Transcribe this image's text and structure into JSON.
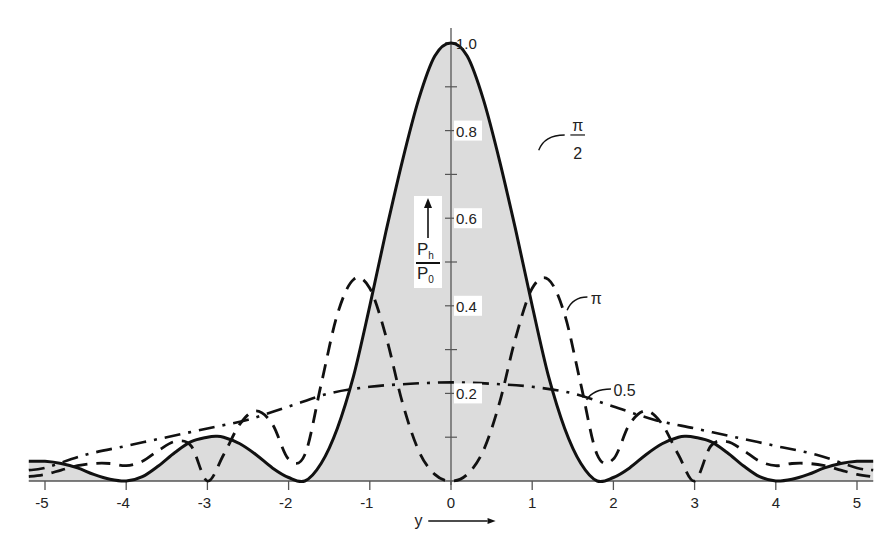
{
  "chart_data": {
    "type": "line",
    "title": "",
    "xlabel": "y",
    "ylabel": "Ph/P0",
    "ylabel_numerator": "P",
    "ylabel_numerator_sub": "h",
    "ylabel_denominator": "P",
    "ylabel_denominator_sub": "0",
    "xlim": [
      -5.2,
      5.2
    ],
    "ylim": [
      0,
      1.0
    ],
    "x_ticks": [
      -5,
      -4,
      -3,
      -2,
      -1,
      0,
      1,
      2,
      3,
      4,
      5
    ],
    "x_tick_labels": [
      "-5",
      "-4",
      "-3",
      "-2",
      "-1",
      "0",
      "1",
      "2",
      "3",
      "4",
      "5"
    ],
    "y_ticks": [
      0.2,
      0.4,
      0.6,
      0.8,
      1.0
    ],
    "y_tick_labels": [
      "0.2",
      "0.4",
      "0.6",
      "0.8",
      "1.0"
    ],
    "grid": false,
    "legend": "inline annotations",
    "series": [
      {
        "name": "π/2",
        "label_num": "π",
        "label_den": "2",
        "style": "solid",
        "filled": true,
        "x": [
          -5.2,
          -5.0,
          -4.8,
          -4.6,
          -4.4,
          -4.2,
          -4.0,
          -3.8,
          -3.6,
          -3.4,
          -3.2,
          -3.0,
          -2.9,
          -2.8,
          -2.6,
          -2.4,
          -2.2,
          -2.0,
          -1.8,
          -1.6,
          -1.4,
          -1.2,
          -1.0,
          -0.8,
          -0.6,
          -0.4,
          -0.2,
          0,
          0.2,
          0.4,
          0.6,
          0.8,
          1.0,
          1.2,
          1.4,
          1.6,
          1.8,
          2.0,
          2.2,
          2.4,
          2.6,
          2.8,
          2.9,
          3.0,
          3.2,
          3.4,
          3.6,
          3.8,
          4.0,
          4.2,
          4.4,
          4.6,
          4.8,
          5.0,
          5.2
        ],
        "values": [
          0.045,
          0.045,
          0.04,
          0.03,
          0.015,
          0.004,
          0.0,
          0.01,
          0.035,
          0.065,
          0.09,
          0.1,
          0.102,
          0.1,
          0.085,
          0.06,
          0.03,
          0.008,
          0.0,
          0.04,
          0.12,
          0.24,
          0.4,
          0.57,
          0.73,
          0.87,
          0.97,
          1.0,
          0.97,
          0.87,
          0.73,
          0.57,
          0.4,
          0.24,
          0.12,
          0.04,
          0.0,
          0.008,
          0.03,
          0.06,
          0.085,
          0.1,
          0.102,
          0.1,
          0.09,
          0.065,
          0.035,
          0.01,
          0.0,
          0.004,
          0.015,
          0.03,
          0.04,
          0.045,
          0.045
        ]
      },
      {
        "name": "π",
        "label": "π",
        "style": "dashed",
        "filled": false,
        "x": [
          -5.2,
          -5.0,
          -4.8,
          -4.6,
          -4.4,
          -4.2,
          -4.0,
          -3.8,
          -3.6,
          -3.4,
          -3.2,
          -3.0,
          -2.8,
          -2.6,
          -2.4,
          -2.2,
          -2.0,
          -1.8,
          -1.6,
          -1.4,
          -1.2,
          -1.0,
          -0.8,
          -0.6,
          -0.4,
          -0.2,
          0,
          0.2,
          0.4,
          0.6,
          0.8,
          1.0,
          1.2,
          1.4,
          1.6,
          1.8,
          2.0,
          2.2,
          2.4,
          2.6,
          2.8,
          3.0,
          3.2,
          3.4,
          3.6,
          3.8,
          4.0,
          4.2,
          4.4,
          4.6,
          4.8,
          5.0,
          5.2
        ],
        "values": [
          0.01,
          0.015,
          0.025,
          0.035,
          0.04,
          0.04,
          0.035,
          0.045,
          0.07,
          0.09,
          0.08,
          0.0,
          0.06,
          0.13,
          0.16,
          0.13,
          0.05,
          0.06,
          0.22,
          0.38,
          0.46,
          0.44,
          0.33,
          0.18,
          0.07,
          0.015,
          0.0,
          0.015,
          0.07,
          0.18,
          0.33,
          0.44,
          0.46,
          0.38,
          0.22,
          0.06,
          0.05,
          0.13,
          0.16,
          0.13,
          0.06,
          0.0,
          0.08,
          0.09,
          0.07,
          0.045,
          0.035,
          0.04,
          0.04,
          0.035,
          0.025,
          0.015,
          0.01
        ]
      },
      {
        "name": "0.5",
        "label": "0.5",
        "style": "dash-dot",
        "filled": false,
        "x": [
          -5.2,
          -5.0,
          -4.5,
          -4.0,
          -3.5,
          -3.0,
          -2.5,
          -2.0,
          -1.5,
          -1.0,
          -0.5,
          0,
          0.5,
          1.0,
          1.5,
          2.0,
          2.5,
          3.0,
          3.5,
          4.0,
          4.5,
          5.0,
          5.2
        ],
        "values": [
          0.025,
          0.03,
          0.06,
          0.08,
          0.1,
          0.12,
          0.14,
          0.17,
          0.2,
          0.215,
          0.222,
          0.225,
          0.222,
          0.215,
          0.2,
          0.17,
          0.14,
          0.12,
          0.1,
          0.08,
          0.06,
          0.03,
          0.025
        ]
      }
    ],
    "annotations": [
      {
        "text": "π/2",
        "x": 1.25,
        "y": 0.77
      },
      {
        "text": "π",
        "x": 1.7,
        "y": 0.4
      },
      {
        "text": "0.5",
        "x": 1.75,
        "y": 0.2
      }
    ],
    "xaxis_arrow": "→",
    "yaxis_arrow": "↑"
  }
}
